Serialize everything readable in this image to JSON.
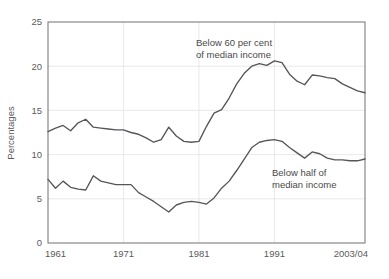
{
  "chart_data": {
    "type": "line",
    "title": "",
    "xlabel": "",
    "ylabel": "Percentages",
    "ylim": [
      0,
      25
    ],
    "yticks": [
      0,
      5,
      10,
      15,
      20,
      25
    ],
    "xticks": [
      "1961",
      "1971",
      "1981",
      "1991",
      "2003/04"
    ],
    "xtick_years": [
      1961,
      1971,
      1981,
      1991,
      2003
    ],
    "xlim": [
      1961,
      2003
    ],
    "grid": "horizontal-and-vertical-light",
    "legend": "inline-annotations",
    "line_color": "#56565a",
    "grid_color": "#e2e2e2",
    "frame_color": "#7d7d7d",
    "annotations": [
      {
        "text_line1": "Below 60 per cent",
        "text_line2": "of median income",
        "x_px": 196,
        "y_px": 46
      },
      {
        "text_line1": "Below half of",
        "text_line2": "median income",
        "x_px": 272,
        "y_px": 176
      }
    ],
    "series": [
      {
        "name": "Below 60 per cent of median income",
        "x": [
          1961,
          1962,
          1963,
          1964,
          1965,
          1966,
          1967,
          1968,
          1969,
          1970,
          1971,
          1972,
          1973,
          1974,
          1975,
          1976,
          1977,
          1978,
          1979,
          1980,
          1981,
          1982,
          1983,
          1984,
          1985,
          1986,
          1987,
          1988,
          1989,
          1990,
          1991,
          1992,
          1993,
          1994,
          1995,
          1996,
          1997,
          1998,
          1999,
          2000,
          2001,
          2002,
          2003
        ],
        "values": [
          12.6,
          13.0,
          13.3,
          12.7,
          13.6,
          14.0,
          13.1,
          13.0,
          12.9,
          12.8,
          12.8,
          12.5,
          12.3,
          11.9,
          11.4,
          11.7,
          13.1,
          12.1,
          11.5,
          11.4,
          11.5,
          13.2,
          14.7,
          15.1,
          16.4,
          18.0,
          19.2,
          20.0,
          20.3,
          20.1,
          20.6,
          20.4,
          19.1,
          18.3,
          17.9,
          19.0,
          18.9,
          18.7,
          18.6,
          18.0,
          17.6,
          17.2,
          17.0
        ]
      },
      {
        "name": "Below half of median income",
        "x": [
          1961,
          1962,
          1963,
          1964,
          1965,
          1966,
          1967,
          1968,
          1969,
          1970,
          1971,
          1972,
          1973,
          1974,
          1975,
          1976,
          1977,
          1978,
          1979,
          1980,
          1981,
          1982,
          1983,
          1984,
          1985,
          1986,
          1987,
          1988,
          1989,
          1990,
          1991,
          1992,
          1993,
          1994,
          1995,
          1996,
          1997,
          1998,
          1999,
          2000,
          2001,
          2002,
          2003
        ],
        "values": [
          7.2,
          6.2,
          7.0,
          6.3,
          6.1,
          6.0,
          7.6,
          7.0,
          6.8,
          6.6,
          6.6,
          6.6,
          5.7,
          5.2,
          4.7,
          4.1,
          3.5,
          4.3,
          4.6,
          4.7,
          4.6,
          4.4,
          5.1,
          6.2,
          7.0,
          8.2,
          9.5,
          10.8,
          11.4,
          11.6,
          11.7,
          11.5,
          10.8,
          10.2,
          9.6,
          10.3,
          10.1,
          9.6,
          9.4,
          9.4,
          9.3,
          9.3,
          9.5
        ]
      }
    ]
  }
}
